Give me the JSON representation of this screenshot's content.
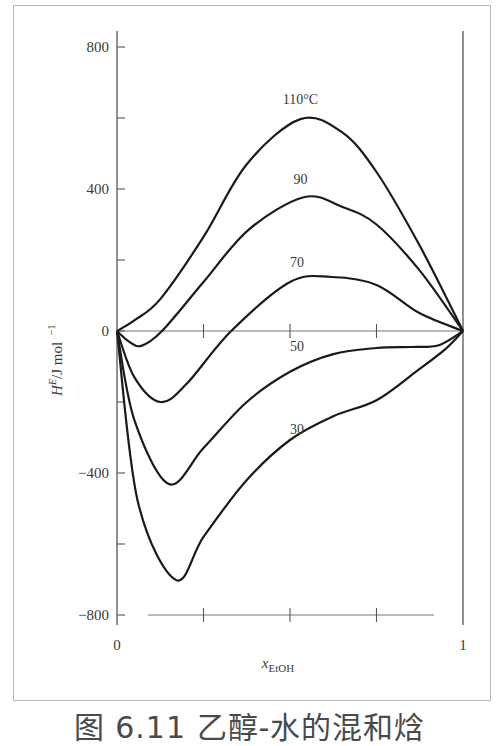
{
  "caption": "图 6.11   乙醇-水的混和焓",
  "chart_data": {
    "type": "line",
    "title": "",
    "xlabel": "x_EtOH",
    "xlabel_main": "x",
    "xlabel_sub": "EtOH",
    "ylabel": "H^E/J mol^-1",
    "ylabel_main": "H",
    "ylabel_sup": "E",
    "ylabel_unit": "/J mol",
    "ylabel_unit_exp": "−1",
    "xlim": [
      0,
      1
    ],
    "ylim": [
      -800,
      800
    ],
    "x_tick_labels": [
      "0",
      "1"
    ],
    "x_ticks": [
      0,
      0.25,
      0.5,
      0.75,
      1
    ],
    "y_ticks": [
      800,
      600,
      400,
      200,
      0,
      -200,
      -400,
      -600,
      -800
    ],
    "y_tick_labels": {
      "800": "800",
      "400": "400",
      "0": "0",
      "-400": "−400",
      "-800": "−800"
    },
    "grid": false,
    "legend": "inline labels",
    "series": [
      {
        "name": "110 °C",
        "label": "110°C",
        "x": [
          0,
          0.05,
          0.125,
          0.25,
          0.375,
          0.53,
          0.65,
          0.75,
          0.875,
          1
        ],
        "y": [
          0,
          30,
          90,
          265,
          470,
          597,
          560,
          448,
          240,
          0
        ]
      },
      {
        "name": "90 °C",
        "label": "90",
        "x": [
          0,
          0.035,
          0.07,
          0.13,
          0.25,
          0.38,
          0.54,
          0.65,
          0.75,
          0.875,
          1
        ],
        "y": [
          0,
          -30,
          -42,
          0,
          138,
          285,
          377,
          350,
          300,
          170,
          0
        ]
      },
      {
        "name": "70 °C",
        "label": "70",
        "x": [
          0,
          0.05,
          0.125,
          0.2,
          0.33,
          0.5,
          0.62,
          0.75,
          0.875,
          1
        ],
        "y": [
          0,
          -130,
          -200,
          -150,
          0,
          138,
          152,
          130,
          50,
          0
        ]
      },
      {
        "name": "50 °C",
        "label": "50",
        "x": [
          0,
          0.05,
          0.15,
          0.25,
          0.375,
          0.5,
          0.625,
          0.75,
          0.85,
          0.93,
          1
        ],
        "y": [
          0,
          -250,
          -431,
          -330,
          -200,
          -115,
          -65,
          -48,
          -45,
          -40,
          0
        ]
      },
      {
        "name": "30 °C",
        "label": "30",
        "x": [
          0,
          0.06,
          0.17,
          0.25,
          0.375,
          0.5,
          0.625,
          0.75,
          0.87,
          0.95,
          1
        ],
        "y": [
          0,
          -480,
          -701,
          -580,
          -420,
          -307,
          -240,
          -195,
          -110,
          -50,
          0
        ]
      }
    ],
    "label_positions": [
      {
        "text": "110°C",
        "x": 0.53,
        "y": 640
      },
      {
        "text": "90",
        "x": 0.53,
        "y": 415
      },
      {
        "text": "70",
        "x": 0.52,
        "y": 180
      },
      {
        "text": "50",
        "x": 0.52,
        "y": -55
      },
      {
        "text": "30",
        "x": 0.52,
        "y": -290
      }
    ]
  }
}
